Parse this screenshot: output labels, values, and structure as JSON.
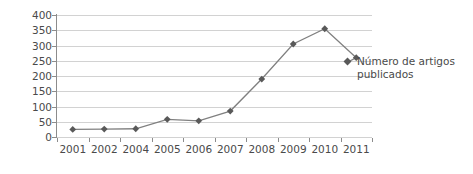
{
  "chart_data": {
    "type": "line",
    "title": "",
    "xlabel": "",
    "ylabel": "",
    "categories": [
      "2001",
      "2002",
      "2004",
      "2005",
      "2006",
      "2007",
      "2008",
      "2009",
      "2010",
      "2011"
    ],
    "series": [
      {
        "name": "Número de artigos publicados",
        "values": [
          25,
          26,
          27,
          58,
          53,
          85,
          190,
          305,
          355,
          260
        ]
      }
    ],
    "ylim": [
      0,
      400
    ],
    "ytick_values": [
      0,
      50,
      100,
      150,
      200,
      250,
      300,
      350,
      400
    ],
    "ytick_labels": [
      "0",
      "50",
      "100",
      "150",
      "200",
      "250",
      "300",
      "350",
      "400"
    ],
    "grid": true,
    "grid_axis": "y",
    "legend_position": "inside-right",
    "legend_entries": [
      "Número de artigos publicados"
    ],
    "marker": "diamond",
    "colors": {
      "series_line": "#808080",
      "marker": "#595959",
      "gridline": "#d2d2d2",
      "axis": "#8c8c8c",
      "text": "#4a4a4a",
      "background": "#ffffff"
    }
  }
}
